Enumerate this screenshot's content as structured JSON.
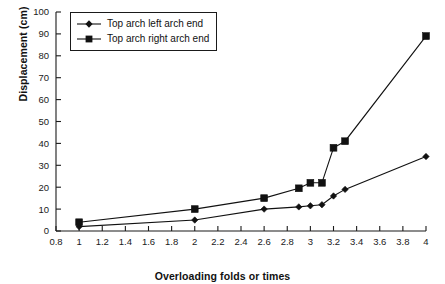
{
  "chart_data": {
    "type": "line",
    "title": "",
    "xlabel": "Overloading folds or times",
    "ylabel": "Displacement (cm)",
    "xlim": [
      0.8,
      4.0
    ],
    "ylim": [
      0,
      100
    ],
    "xticks": [
      "0.8",
      "1",
      "1.2",
      "1.4",
      "1.6",
      "1.8",
      "2",
      "2.2",
      "2.4",
      "2.6",
      "2.8",
      "3",
      "3.2",
      "3.4",
      "3.6",
      "3.8",
      "4"
    ],
    "xtick_values": [
      0.8,
      1.0,
      1.2,
      1.4,
      1.6,
      1.8,
      2.0,
      2.2,
      2.4,
      2.6,
      2.8,
      3.0,
      3.2,
      3.4,
      3.6,
      3.8,
      4.0
    ],
    "yticks": [
      "0",
      "10",
      "20",
      "30",
      "40",
      "50",
      "60",
      "70",
      "80",
      "90",
      "100"
    ],
    "ytick_values": [
      0,
      10,
      20,
      30,
      40,
      50,
      60,
      70,
      80,
      90,
      100
    ],
    "grid": false,
    "legend_position": "top-left-inside",
    "series": [
      {
        "name": "Top arch left arch end",
        "marker": "diamond",
        "color": "#111111",
        "x": [
          1.0,
          2.0,
          2.6,
          2.9,
          3.0,
          3.1,
          3.2,
          3.3,
          4.0
        ],
        "y": [
          2,
          5,
          10,
          11,
          11.5,
          12,
          16,
          19,
          34
        ]
      },
      {
        "name": "Top arch right arch end",
        "marker": "square",
        "color": "#111111",
        "x": [
          1.0,
          2.0,
          2.6,
          2.9,
          3.0,
          3.1,
          3.2,
          3.3,
          4.0
        ],
        "y": [
          4,
          10,
          15,
          19.5,
          22,
          22,
          38,
          41,
          89
        ]
      }
    ]
  },
  "legend": {
    "items": [
      {
        "label": "Top arch left arch end",
        "marker": "diamond"
      },
      {
        "label": "Top arch right arch end",
        "marker": "square"
      }
    ]
  }
}
